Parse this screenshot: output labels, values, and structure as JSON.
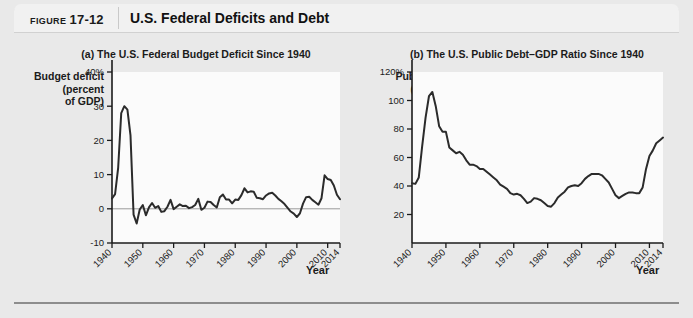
{
  "figure": {
    "number_word": "FIGURE",
    "number_value": "17-12",
    "title": "U.S. Federal Deficits and Debt"
  },
  "colors": {
    "page_background": "#e9e9e9",
    "header_background": "#f1f1f1",
    "plot_background": "#fbfbfb",
    "line": "#2b2b2b",
    "axis": "#1b1b1b",
    "zero_line": "#9a9a9a",
    "rule": "#8d8d8d"
  },
  "chart_data": [
    {
      "id": "panel-a",
      "type": "line",
      "title": "(a) The U.S. Federal Budget Deficit Since 1940",
      "ylabel": "Budget deficit\n(percent\nof GDP)",
      "xlabel": "Year",
      "ylim": [
        -10,
        40
      ],
      "xlim": [
        1940,
        2014
      ],
      "yticks": [
        40,
        30,
        20,
        10,
        0,
        -10
      ],
      "ytick_labels": [
        "40%",
        "30",
        "20",
        "10",
        "0",
        "-10"
      ],
      "xticks": [
        1940,
        1950,
        1960,
        1970,
        1980,
        1990,
        2000,
        2010,
        2014
      ],
      "xtick_labels": [
        "1940",
        "1950",
        "1960",
        "1970",
        "1980",
        "1990",
        "2000",
        "2010",
        "2014"
      ],
      "grid": false,
      "zero_line": true,
      "legend": "none",
      "series": [
        {
          "name": "Budget deficit (percent of GDP)",
          "x": [
            1940,
            1941,
            1942,
            1943,
            1944,
            1945,
            1946,
            1947,
            1948,
            1949,
            1950,
            1951,
            1952,
            1953,
            1954,
            1955,
            1956,
            1957,
            1958,
            1959,
            1960,
            1961,
            1962,
            1963,
            1964,
            1965,
            1966,
            1967,
            1968,
            1969,
            1970,
            1971,
            1972,
            1973,
            1974,
            1975,
            1976,
            1977,
            1978,
            1979,
            1980,
            1981,
            1982,
            1983,
            1984,
            1985,
            1986,
            1987,
            1988,
            1989,
            1990,
            1991,
            1992,
            1993,
            1994,
            1995,
            1996,
            1997,
            1998,
            1999,
            2000,
            2001,
            2002,
            2003,
            2004,
            2005,
            2006,
            2007,
            2008,
            2009,
            2010,
            2011,
            2012,
            2013,
            2014
          ],
          "values": [
            3.0,
            4.3,
            12.0,
            28.0,
            30.0,
            29.0,
            21.5,
            -1.7,
            -4.3,
            -0.2,
            1.1,
            -1.9,
            0.4,
            1.7,
            0.3,
            0.8,
            -0.9,
            -0.7,
            0.6,
            2.6,
            -0.1,
            0.6,
            1.3,
            0.8,
            0.9,
            0.2,
            0.5,
            1.1,
            2.9,
            -0.3,
            0.3,
            2.1,
            2.0,
            1.1,
            0.4,
            3.4,
            4.2,
            2.7,
            2.7,
            1.6,
            2.7,
            2.6,
            4.0,
            6.0,
            4.8,
            5.1,
            5.0,
            3.2,
            3.1,
            2.8,
            3.9,
            4.5,
            4.7,
            3.9,
            2.9,
            2.2,
            1.4,
            0.3,
            -0.8,
            -1.4,
            -2.4,
            -1.3,
            1.5,
            3.4,
            3.5,
            2.6,
            1.9,
            1.2,
            3.1,
            9.8,
            8.7,
            8.4,
            6.8,
            4.1,
            2.8
          ]
        }
      ]
    },
    {
      "id": "panel-b",
      "type": "line",
      "title": "(b) The U.S. Public Debt–GDP Ratio Since 1940",
      "ylabel": "Public debt\n(percent\nof GDP)",
      "xlabel": "Year",
      "ylim": [
        0,
        120
      ],
      "xlim": [
        1940,
        2014
      ],
      "yticks": [
        120,
        100,
        80,
        60,
        40,
        20
      ],
      "ytick_labels": [
        "120%",
        "100",
        "80",
        "60",
        "40",
        "20"
      ],
      "xticks": [
        1940,
        1950,
        1960,
        1970,
        1980,
        1990,
        2000,
        2010,
        2014
      ],
      "xtick_labels": [
        "1940",
        "1950",
        "1960",
        "1970",
        "1980",
        "1990",
        "2000",
        "2010",
        "2014"
      ],
      "grid": false,
      "zero_line": false,
      "legend": "none",
      "series": [
        {
          "name": "Public debt (percent of GDP)",
          "x": [
            1940,
            1941,
            1942,
            1943,
            1944,
            1945,
            1946,
            1947,
            1948,
            1949,
            1950,
            1951,
            1952,
            1953,
            1954,
            1955,
            1956,
            1957,
            1958,
            1959,
            1960,
            1961,
            1962,
            1963,
            1964,
            1965,
            1966,
            1967,
            1968,
            1969,
            1970,
            1971,
            1972,
            1973,
            1974,
            1975,
            1976,
            1977,
            1978,
            1979,
            1980,
            1981,
            1982,
            1983,
            1984,
            1985,
            1986,
            1987,
            1988,
            1989,
            1990,
            1991,
            1992,
            1993,
            1994,
            1995,
            1996,
            1997,
            1998,
            1999,
            2000,
            2001,
            2002,
            2003,
            2004,
            2005,
            2006,
            2007,
            2008,
            2009,
            2010,
            2011,
            2012,
            2013,
            2014
          ],
          "values": [
            42.0,
            41.5,
            46.0,
            68.0,
            88.0,
            103.0,
            106.0,
            96.0,
            82.0,
            78.0,
            78.0,
            67.0,
            65.0,
            63.0,
            64.0,
            62.0,
            58.0,
            55.0,
            55.0,
            54.0,
            52.0,
            52.0,
            50.0,
            48.0,
            46.0,
            44.0,
            41.0,
            39.5,
            38.0,
            35.0,
            34.0,
            34.5,
            33.5,
            31.0,
            28.0,
            29.0,
            31.5,
            31.0,
            30.0,
            28.0,
            26.0,
            25.5,
            28.0,
            32.0,
            34.0,
            36.0,
            39.0,
            40.0,
            40.5,
            40.0,
            42.0,
            45.0,
            47.0,
            48.5,
            48.5,
            48.5,
            47.5,
            45.0,
            42.5,
            38.0,
            33.5,
            31.5,
            33.0,
            34.5,
            35.5,
            35.5,
            35.0,
            35.0,
            39.0,
            52.0,
            61.0,
            65.0,
            70.0,
            72.0,
            74.0
          ]
        }
      ]
    }
  ]
}
